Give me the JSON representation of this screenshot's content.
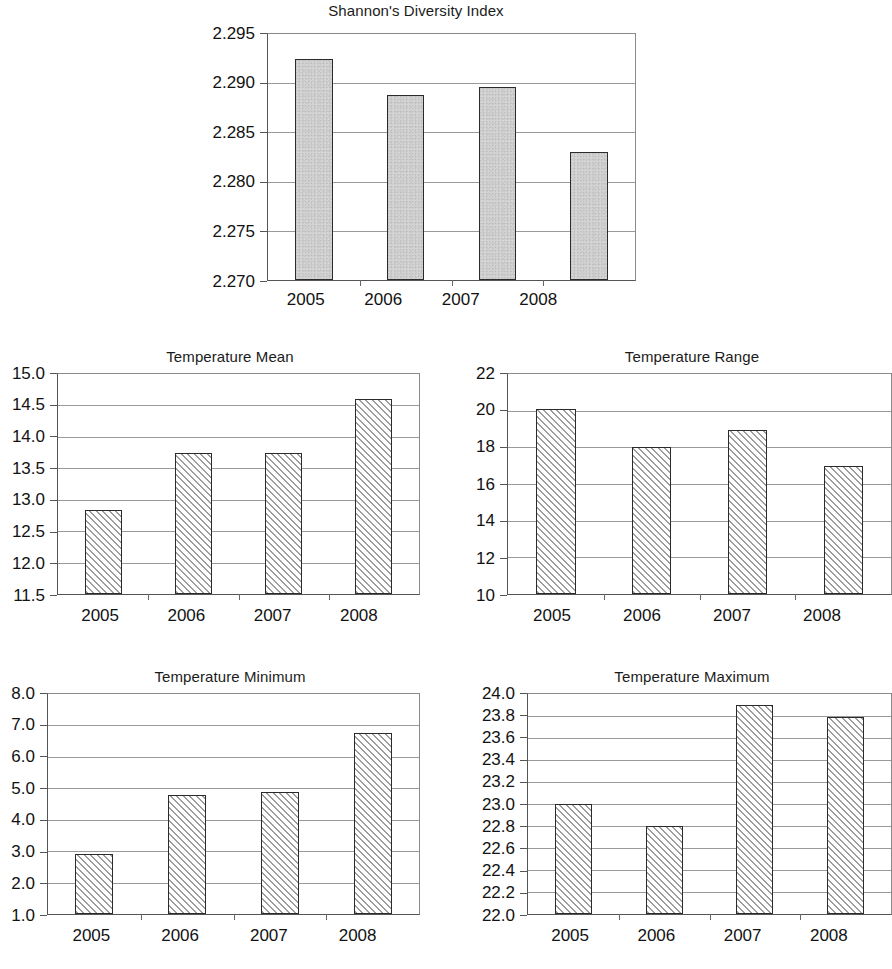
{
  "figure": {
    "panel_count": 4,
    "categories": [
      "2005",
      "2006",
      "2007",
      "2008"
    ]
  },
  "chart_data": [
    {
      "id": "shannon",
      "type": "bar",
      "title": "Shannon's Diversity Index",
      "xlabel": "",
      "ylabel": "",
      "categories": [
        "2005",
        "2006",
        "2007",
        "2008"
      ],
      "values": [
        2.2925,
        2.2888,
        2.2896,
        2.283
      ],
      "ytick_labels": [
        "2.295",
        "2.290",
        "2.285",
        "2.280",
        "2.275",
        "2.270"
      ],
      "ytick_values": [
        2.295,
        2.29,
        2.285,
        2.28,
        2.275,
        2.27
      ],
      "ylim": [
        2.27,
        2.295
      ],
      "grid": true,
      "legend": "none",
      "bar_fill": "speckled-gray",
      "bar_fill_color": "#d4d4d4",
      "bar_edge_color": "#2b2b2b"
    },
    {
      "id": "temp_mean",
      "type": "bar",
      "title": "Temperature Mean",
      "xlabel": "",
      "ylabel": "",
      "categories": [
        "2005",
        "2006",
        "2007",
        "2008"
      ],
      "values": [
        12.83,
        13.74,
        13.75,
        14.6
      ],
      "ytick_labels": [
        "15.0",
        "14.5",
        "14.0",
        "13.5",
        "13.0",
        "12.5",
        "12.0",
        "11.5"
      ],
      "ytick_values": [
        15.0,
        14.5,
        14.0,
        13.5,
        13.0,
        12.5,
        12.0,
        11.5
      ],
      "ylim": [
        11.5,
        15.0
      ],
      "grid": true,
      "legend": "none",
      "bar_fill": "diagonal-hatch",
      "bar_fill_color": "#9d9d9d",
      "bar_edge_color": "#2b2b2b"
    },
    {
      "id": "temp_range",
      "type": "bar",
      "title": "Temperature Range",
      "xlabel": "",
      "ylabel": "",
      "categories": [
        "2005",
        "2006",
        "2007",
        "2008"
      ],
      "values": [
        20.1,
        18.0,
        18.95,
        17.0
      ],
      "ytick_labels": [
        "22",
        "20",
        "18",
        "16",
        "14",
        "12",
        "10"
      ],
      "ytick_values": [
        22,
        20,
        18,
        16,
        14,
        12,
        10
      ],
      "ylim": [
        10,
        22
      ],
      "grid": true,
      "legend": "none",
      "bar_fill": "diagonal-hatch",
      "bar_fill_color": "#9d9d9d",
      "bar_edge_color": "#2b2b2b"
    },
    {
      "id": "temp_min",
      "type": "bar",
      "title": "Temperature Minimum",
      "xlabel": "",
      "ylabel": "",
      "categories": [
        "2005",
        "2006",
        "2007",
        "2008"
      ],
      "values": [
        2.9,
        4.8,
        4.87,
        6.75
      ],
      "ytick_labels": [
        "8.0",
        "7.0",
        "6.0",
        "5.0",
        "4.0",
        "3.0",
        "2.0",
        "1.0"
      ],
      "ytick_values": [
        8.0,
        7.0,
        6.0,
        5.0,
        4.0,
        3.0,
        2.0,
        1.0
      ],
      "ylim": [
        1.0,
        8.0
      ],
      "grid": true,
      "legend": "none",
      "bar_fill": "diagonal-hatch",
      "bar_fill_color": "#9d9d9d",
      "bar_edge_color": "#2b2b2b"
    },
    {
      "id": "temp_max",
      "type": "bar",
      "title": "Temperature Maximum",
      "xlabel": "",
      "ylabel": "",
      "categories": [
        "2005",
        "2006",
        "2007",
        "2008"
      ],
      "values": [
        23.0,
        22.8,
        23.9,
        23.79
      ],
      "ytick_labels": [
        "24.0",
        "23.8",
        "23.6",
        "23.4",
        "23.2",
        "23.0",
        "22.8",
        "22.6",
        "22.4",
        "22.2",
        "22.0"
      ],
      "ytick_values": [
        24.0,
        23.8,
        23.6,
        23.4,
        23.2,
        23.0,
        22.8,
        22.6,
        22.4,
        22.2,
        22.0
      ],
      "ylim": [
        22.0,
        24.0
      ],
      "grid": true,
      "legend": "none",
      "bar_fill": "diagonal-hatch",
      "bar_fill_color": "#9d9d9d",
      "bar_edge_color": "#2b2b2b"
    }
  ]
}
